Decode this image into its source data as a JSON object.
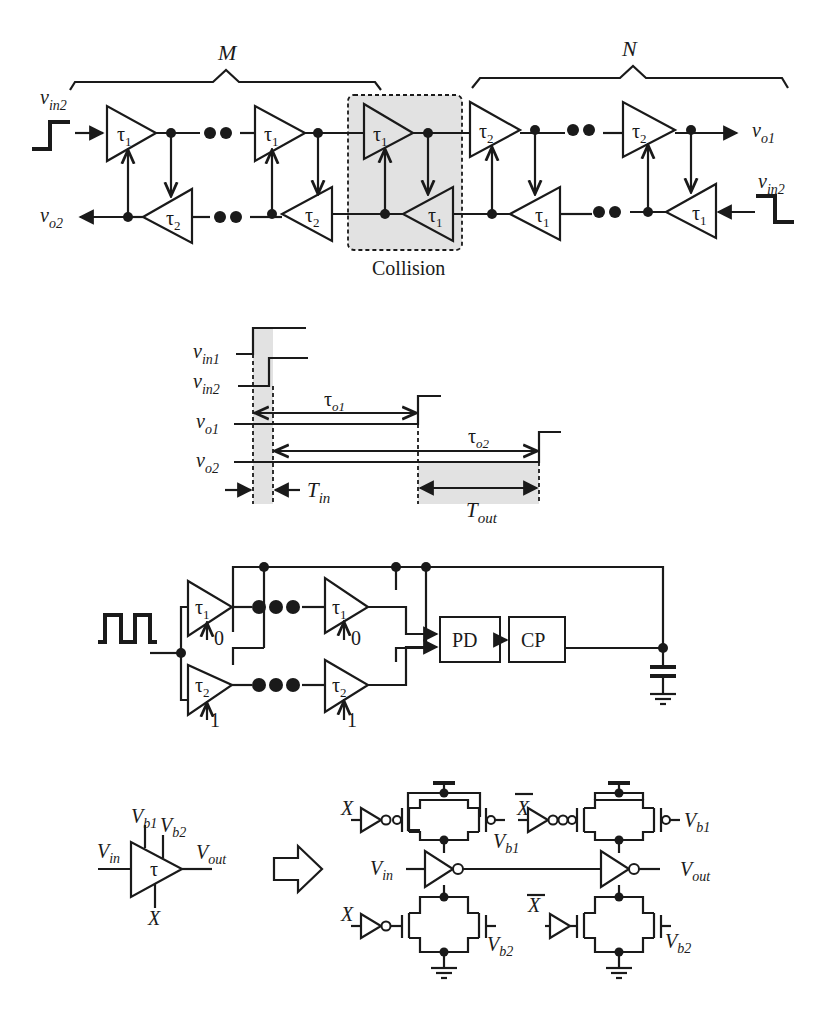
{
  "figure": {
    "background": "#ffffff",
    "ink_color": "#1a1a1a",
    "shade_color": "#e2e2e2"
  },
  "panel_a": {
    "brace_left_label": "M",
    "brace_right_label": "N",
    "input_left_label": "v",
    "input_left_sub": "in2",
    "input_right_label": "v",
    "input_right_sub": "in2",
    "output_top_label": "v",
    "output_top_sub": "o1",
    "output_bottom_label": "v",
    "output_bottom_sub": "o2",
    "collision_label": "Collision",
    "top_row_taus": [
      "τ",
      "τ",
      "τ",
      "τ",
      "τ"
    ],
    "top_row_subs": [
      "1",
      "1",
      "1",
      "2",
      "2"
    ],
    "bottom_row_taus": [
      "τ",
      "τ",
      "τ",
      "τ",
      "τ"
    ],
    "bottom_row_subs": [
      "2",
      "2",
      "1",
      "1",
      "1"
    ],
    "ellipsis": "••"
  },
  "panel_b": {
    "signals": [
      {
        "label": "v",
        "sub": "in1"
      },
      {
        "label": "v",
        "sub": "in2"
      },
      {
        "label": "v",
        "sub": "o1"
      },
      {
        "label": "v",
        "sub": "o2"
      }
    ],
    "delay1_label": "τ",
    "delay1_sub": "o1",
    "delay2_label": "τ",
    "delay2_sub": "o2",
    "tin_label": "T",
    "tin_sub": "in",
    "tout_label": "T",
    "tout_sub": "out"
  },
  "panel_c": {
    "top_row_taus": [
      "τ",
      "τ"
    ],
    "top_row_subs": [
      "1",
      "1"
    ],
    "top_row_controls": [
      "0",
      "0"
    ],
    "bottom_row_taus": [
      "τ",
      "τ"
    ],
    "bottom_row_subs": [
      "2",
      "2"
    ],
    "bottom_row_controls": [
      "1",
      "1"
    ],
    "ellipsis": "●●●",
    "pd_label": "PD",
    "cp_label": "CP"
  },
  "panel_d": {
    "cell_tau": "τ",
    "vin_label": "V",
    "vin_sub": "in",
    "vout_label": "V",
    "vout_sub": "out",
    "vb1_label": "V",
    "vb1_sub": "b1",
    "vb2_label": "V",
    "vb2_sub": "b2",
    "x_label": "X",
    "xbar_label": "X",
    "arrow": "implementation-arrow"
  }
}
